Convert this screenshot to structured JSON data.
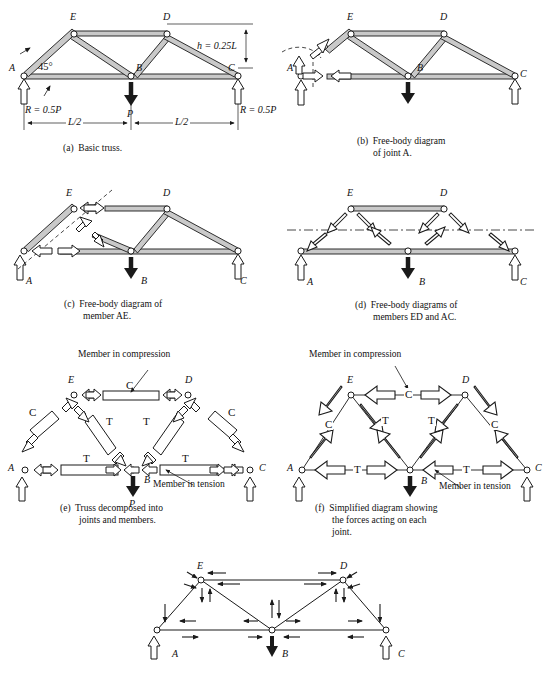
{
  "figure": {
    "title_implicit": "Truss analysis free-body diagrams",
    "width": 554,
    "height": 674,
    "ink_color": "#1a1a1a",
    "member_fill": "#c9c9c9",
    "arrow_fill": "#ffffff"
  },
  "panels": [
    {
      "id": "a",
      "caption": "(a)  Basic truss.",
      "joint_labels": [
        "E",
        "D",
        "A",
        "B",
        "C"
      ],
      "annotations": {
        "angle": "45°",
        "height": "h = 0.25L",
        "reaction_left": "R = 0.5P",
        "reaction_right": "R = 0.5P",
        "load": "P",
        "span_left": "L/2",
        "span_right": "L/2"
      }
    },
    {
      "id": "b",
      "caption_line1": "(b)  Free-body diagram",
      "caption_line2": "of joint A.",
      "joint_labels": [
        "E",
        "D",
        "A",
        "B",
        "C"
      ]
    },
    {
      "id": "c",
      "caption_line1": "(c)  Free-body diagram of",
      "caption_line2": "member AE.",
      "joint_labels": [
        "E",
        "D",
        "A",
        "B",
        "C"
      ]
    },
    {
      "id": "d",
      "caption_line1": "(d)  Free-body diagrams of",
      "caption_line2": "members ED and AC.",
      "joint_labels": [
        "E",
        "D",
        "A",
        "B",
        "C"
      ]
    },
    {
      "id": "e",
      "caption_line1": "(e)  Truss decomposed into",
      "caption_line2": "joints and members.",
      "joint_labels": [
        "E",
        "D",
        "A",
        "B",
        "C"
      ],
      "load": "P",
      "member_marks": [
        "C",
        "C",
        "C",
        "T",
        "T",
        "T",
        "T"
      ],
      "callout_compression": "Member in compression",
      "callout_tension": "Member in tension"
    },
    {
      "id": "f",
      "caption_line1": "(f)  Simplified diagram showing",
      "caption_line2": "the forces acting on each",
      "caption_line3": "joint.",
      "joint_labels": [
        "E",
        "D",
        "A",
        "B",
        "C"
      ],
      "member_marks": [
        "C",
        "C",
        "C",
        "T",
        "T",
        "T",
        "T"
      ],
      "callout_compression": "Member in compression",
      "callout_tension": "Member in tension"
    },
    {
      "id": "g",
      "caption": "",
      "joint_labels": [
        "E",
        "D",
        "A",
        "B",
        "C"
      ]
    }
  ]
}
